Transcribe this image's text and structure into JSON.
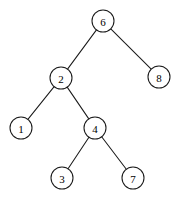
{
  "figure": {
    "width": 179,
    "height": 205,
    "background_color": "#ffffff",
    "stroke_color": "#1a1a1a",
    "label_color": "#000000",
    "node_fill": "#ffffff",
    "node_radius": 11,
    "stroke_width": 1.05
  },
  "chart_data": {
    "type": "diagram",
    "diagram_kind": "binary-tree",
    "title": "",
    "xlabel": "",
    "ylabel": "",
    "grid": false,
    "legend": null,
    "nodes": [
      {
        "id": "n6",
        "label": "6",
        "x": 103,
        "y": 21,
        "depth": 0,
        "role": "root"
      },
      {
        "id": "n2",
        "label": "2",
        "x": 61,
        "y": 78,
        "depth": 1,
        "role": "left-child"
      },
      {
        "id": "n8",
        "label": "8",
        "x": 159,
        "y": 77,
        "depth": 1,
        "role": "right-child"
      },
      {
        "id": "n1",
        "label": "1",
        "x": 21,
        "y": 128,
        "depth": 2,
        "role": "leaf"
      },
      {
        "id": "n4",
        "label": "4",
        "x": 95,
        "y": 128,
        "depth": 2,
        "role": "internal"
      },
      {
        "id": "n3",
        "label": "3",
        "x": 62,
        "y": 178,
        "depth": 3,
        "role": "leaf"
      },
      {
        "id": "n7",
        "label": "7",
        "x": 133,
        "y": 178,
        "depth": 3,
        "role": "leaf"
      }
    ],
    "edges": [
      {
        "id": "e6-2",
        "from": "n6",
        "to": "n2",
        "side": "left"
      },
      {
        "id": "e6-8",
        "from": "n6",
        "to": "n8",
        "side": "right"
      },
      {
        "id": "e2-1",
        "from": "n2",
        "to": "n1",
        "side": "left"
      },
      {
        "id": "e2-4",
        "from": "n2",
        "to": "n4",
        "side": "right"
      },
      {
        "id": "e4-3",
        "from": "n4",
        "to": "n3",
        "side": "left"
      },
      {
        "id": "e4-7",
        "from": "n4",
        "to": "n7",
        "side": "right"
      }
    ],
    "values": [
      6,
      2,
      8,
      1,
      4,
      3,
      7
    ],
    "categories": [
      "6",
      "2",
      "8",
      "1",
      "4",
      "3",
      "7"
    ]
  }
}
